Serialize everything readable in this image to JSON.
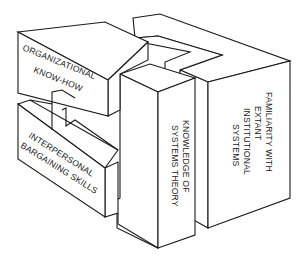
{
  "diagram": {
    "type": "isometric-block-puzzle",
    "blocks": [
      {
        "id": "organizational",
        "lines": [
          "ORGANIZATIONAL",
          "KNOW-HOW"
        ]
      },
      {
        "id": "interpersonal",
        "lines": [
          "INTERPERSONAL",
          "BARGAINING SKILLS"
        ]
      },
      {
        "id": "systems",
        "lines": [
          "KNOWLEDGE OF",
          "SYSTEMS THEORY"
        ]
      },
      {
        "id": "familiarity",
        "lines": [
          "FAMILIARITY WITH",
          "EXTANT",
          "INSTITUTIONAL",
          "SYSTEMS"
        ]
      }
    ],
    "colors": {
      "stroke": "#1a1a1a",
      "fill": "#ffffff"
    }
  }
}
